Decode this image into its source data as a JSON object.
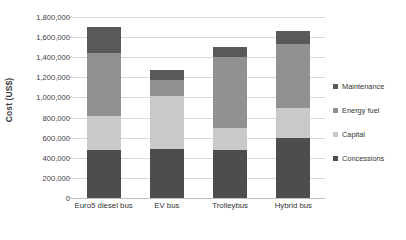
{
  "chart_data": {
    "type": "bar",
    "variant": "stacked-column",
    "title": "",
    "xlabel": "",
    "ylabel": "Cost (US$)",
    "categories": [
      "Euro5 diesel bus",
      "EV bus",
      "Trolleybus",
      "Hybrid bus"
    ],
    "ylim": [
      0,
      1800000
    ],
    "ytick_step": 200000,
    "ytick_labels": [
      "1,800,000",
      "1,600,000",
      "1,400,000",
      "1,200,000",
      "1,000,000",
      "800,000",
      "600,000",
      "400,000",
      "200,000",
      "0"
    ],
    "ytick_values": [
      1800000,
      1600000,
      1400000,
      1200000,
      1000000,
      800000,
      600000,
      400000,
      200000,
      0
    ],
    "grid": true,
    "grid_axis": "y",
    "legend_position": "right",
    "stack_order_bottom_to_top": [
      "Concessions",
      "Capital",
      "Energy fuel",
      "Maintenance"
    ],
    "series": [
      {
        "name": "Maintenance",
        "color": "#595959",
        "values": [
          260000,
          100000,
          100000,
          135000
        ]
      },
      {
        "name": "Energy fuel",
        "color": "#919191",
        "values": [
          620000,
          160000,
          700000,
          630000
        ]
      },
      {
        "name": "Capital",
        "color": "#c9c9c9",
        "values": [
          340000,
          520000,
          220000,
          300000
        ]
      },
      {
        "name": "Concessions",
        "color": "#4d4d4d",
        "values": [
          480000,
          490000,
          480000,
          600000
        ]
      }
    ],
    "totals": [
      1700000,
      1270000,
      1500000,
      1665000
    ]
  },
  "legend": {
    "items": [
      {
        "label": "Maintenance",
        "color": "#595959"
      },
      {
        "label": "Energy fuel",
        "color": "#919191"
      },
      {
        "label": "Capital",
        "color": "#c9c9c9"
      },
      {
        "label": "Concessions",
        "color": "#4d4d4d"
      }
    ]
  },
  "colors": {
    "gridline": "#d9d9d9",
    "axis": "#bdbdbd",
    "text": "#333333",
    "background": "#ffffff"
  }
}
